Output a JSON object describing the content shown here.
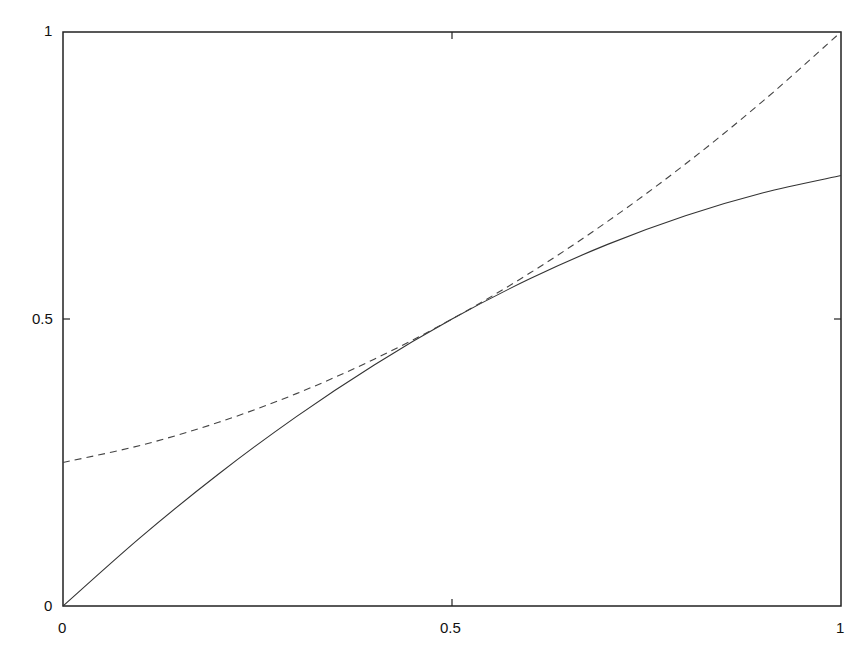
{
  "chart_data": {
    "type": "line",
    "title": "",
    "xlabel": "",
    "ylabel": "",
    "xlim": [
      0,
      1
    ],
    "ylim": [
      0,
      1
    ],
    "grid": false,
    "legend": null,
    "x_ticks": [
      "0",
      "0.5",
      "1"
    ],
    "y_ticks": [
      "0",
      "0.5",
      "1"
    ],
    "series": [
      {
        "name": "solid curve",
        "style": "solid",
        "color": "#333333",
        "x": [
          0,
          0.1,
          0.2,
          0.3,
          0.4,
          0.5,
          0.6,
          0.7,
          0.8,
          0.9,
          1.0
        ],
        "values": [
          0,
          0.12,
          0.23,
          0.33,
          0.42,
          0.5,
          0.57,
          0.63,
          0.68,
          0.72,
          0.75
        ]
      },
      {
        "name": "dashed curve",
        "style": "dashed",
        "color": "#444444",
        "x": [
          0,
          0.1,
          0.2,
          0.3,
          0.4,
          0.5,
          0.6,
          0.7,
          0.8,
          0.9,
          1.0
        ],
        "values": [
          0.25,
          0.28,
          0.32,
          0.37,
          0.43,
          0.5,
          0.58,
          0.67,
          0.77,
          0.88,
          1.0
        ]
      }
    ]
  },
  "axes": {
    "x_labels": [
      "0",
      "0.5",
      "1"
    ],
    "y_labels": [
      "0",
      "0.5",
      "1"
    ]
  }
}
